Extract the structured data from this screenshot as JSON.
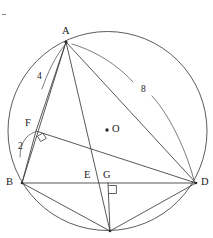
{
  "figure": {
    "type": "geometry-diagram"
  },
  "circle": {
    "name": "circumscribed-circle",
    "center_label": "O",
    "center_x": 107.5,
    "center_y": 131,
    "radius": 99.5
  },
  "points": [
    {
      "id": "A",
      "label": "A",
      "x": 66,
      "y": 42,
      "label_x": 62,
      "label_y": 26
    },
    {
      "id": "B",
      "label": "B",
      "x": 22,
      "y": 183,
      "label_x": 6,
      "label_y": 177
    },
    {
      "id": "D",
      "label": "D",
      "x": 196,
      "y": 183,
      "label_x": 201,
      "label_y": 177
    },
    {
      "id": "F",
      "label": "F",
      "x": 36,
      "y": 131,
      "label_x": 25,
      "label_y": 118
    },
    {
      "id": "E",
      "label": "E",
      "x": 97,
      "y": 183,
      "label_x": 84,
      "label_y": 170
    },
    {
      "id": "G",
      "label": "G",
      "x": 108,
      "y": 183,
      "label_x": 103,
      "label_y": 170
    },
    {
      "id": "H",
      "label": "",
      "x": 110,
      "y": 231,
      "label_x": 110,
      "label_y": 231
    }
  ],
  "center_marker": {
    "label": "O",
    "dot_x": 107,
    "dot_y": 130,
    "label_x": 112,
    "label_y": 124
  },
  "measurements": [
    {
      "id": "seg-AF",
      "value": "4",
      "label_x": 37,
      "label_y": 72,
      "refers_to": "AF"
    },
    {
      "id": "seg-AD",
      "value": "8",
      "label_x": 141,
      "label_y": 85,
      "refers_to": "AD"
    },
    {
      "id": "seg-BF",
      "value": "2",
      "label_x": 18,
      "label_y": 142,
      "refers_to": "BF"
    }
  ],
  "segments": [
    {
      "id": "A-B",
      "from": "A",
      "to": "B"
    },
    {
      "id": "A-F-B",
      "from": "A",
      "to": "B",
      "through": "F"
    },
    {
      "id": "A-E-H",
      "from": "A",
      "to": "H",
      "through": "E"
    },
    {
      "id": "A-D",
      "from": "A",
      "to": "D"
    },
    {
      "id": "B-D",
      "from": "B",
      "to": "D"
    },
    {
      "id": "F-D",
      "from": "F",
      "to": "D"
    },
    {
      "id": "B-H",
      "from": "B",
      "to": "H"
    },
    {
      "id": "H-D",
      "from": "H",
      "to": "D"
    },
    {
      "id": "G-H",
      "from": "G",
      "to": "H"
    }
  ],
  "right_angles": [
    {
      "id": "right-angle-at-F",
      "vertex": "F",
      "x": 40,
      "y": 136
    },
    {
      "id": "right-angle-at-G",
      "vertex": "G",
      "x": 108,
      "y": 184
    }
  ],
  "leaders": [
    {
      "id": "leader-4",
      "from_label": "4",
      "to_point": "A"
    },
    {
      "id": "leader-8-upper",
      "from_label": "8",
      "to_point": "A"
    },
    {
      "id": "leader-8-lower",
      "from_label": "8",
      "to_point": "D"
    },
    {
      "id": "leader-2",
      "from_label": "2",
      "to_point": "F"
    }
  ],
  "colors": {
    "stroke": "#3a3a3a",
    "circle_stroke": "#4a4a4a",
    "text": "#1a1a1a",
    "background": "#ffffff"
  }
}
